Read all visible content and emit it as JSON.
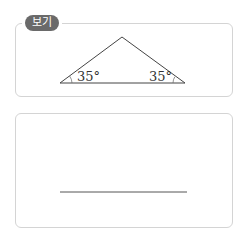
{
  "example_box": {
    "label": "보기",
    "figure": {
      "shape": "isosceles-triangle",
      "left_angle": "35°",
      "right_angle": "35°"
    }
  },
  "answer_box": {
    "answer_line": ""
  }
}
